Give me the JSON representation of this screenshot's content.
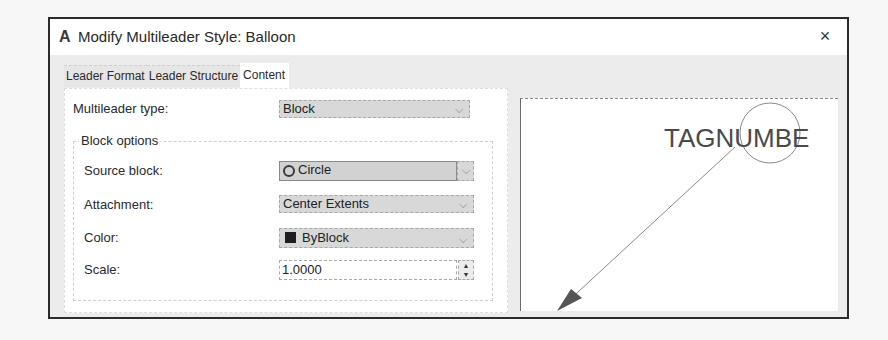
{
  "window": {
    "app_icon": "A",
    "title": "Modify Multileader Style: Balloon",
    "close_icon": "×"
  },
  "tabs": [
    {
      "label": "Leader Format",
      "active": false
    },
    {
      "label": "Leader Structure",
      "active": false
    },
    {
      "label": "Content",
      "active": true
    }
  ],
  "content": {
    "multileader_type": {
      "label": "Multileader type:",
      "value": "Block"
    },
    "block_options": {
      "title": "Block options",
      "source_block": {
        "label": "Source block:",
        "value": "Circle",
        "icon": "circle-icon"
      },
      "attachment": {
        "label": "Attachment:",
        "value": "Center Extents"
      },
      "color": {
        "label": "Color:",
        "value": "ByBlock",
        "swatch": "#1e1e1e"
      },
      "scale": {
        "label": "Scale:",
        "value": "1.0000"
      }
    }
  },
  "preview": {
    "tag_text": "TAGNUMBE",
    "line_color": "#888888",
    "text_color": "#4a4a4a"
  },
  "icons": {
    "chevron": "⌵",
    "spin_up": "▲",
    "spin_down": "▼"
  }
}
